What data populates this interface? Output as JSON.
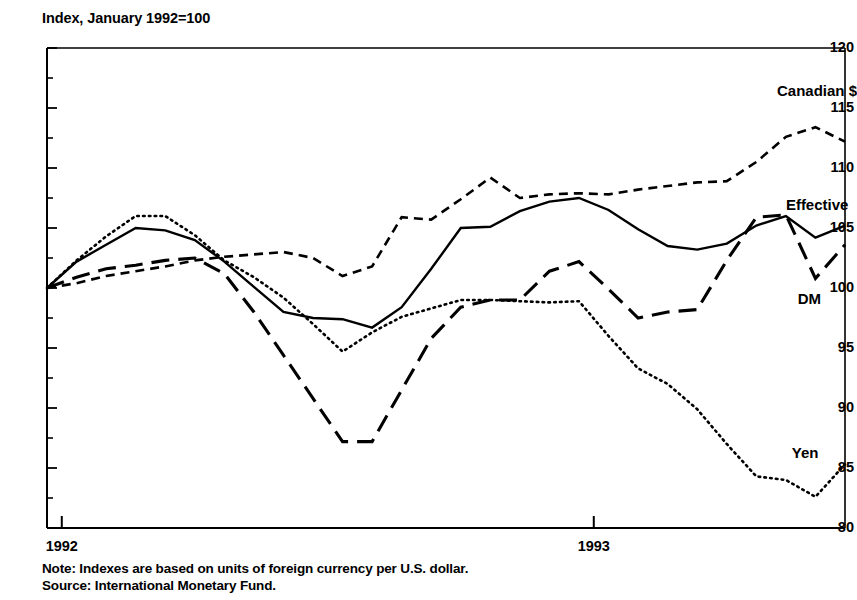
{
  "chart_data": {
    "type": "line",
    "title": "Index, January 1992=100",
    "xlabel": "",
    "ylabel": "Index, January 1992=100",
    "ylim": [
      80,
      120
    ],
    "ytick_labels": [
      "120",
      "115",
      "110",
      "105",
      "100",
      "95",
      "90",
      "85",
      "80"
    ],
    "ytick_values": [
      120,
      115,
      110,
      105,
      100,
      95,
      90,
      85,
      80
    ],
    "yminor_step": 2.5,
    "xtick_labels": [
      "1992",
      "1993"
    ],
    "xtick_values": [
      0.5,
      18.5
    ],
    "xlim": [
      0,
      27
    ],
    "grid": false,
    "legend": "inline-labels",
    "x": [
      0,
      1,
      2,
      3,
      4,
      5,
      6,
      7,
      8,
      9,
      10,
      11,
      12,
      13,
      14,
      15,
      16,
      17,
      18,
      19,
      20,
      21,
      22,
      23,
      24,
      25,
      26,
      27
    ],
    "series": [
      {
        "name": "Canadian $",
        "style": "short-dash",
        "label_x": 24.7,
        "label_y": 116.3,
        "values": [
          100.0,
          100.4,
          101.0,
          101.4,
          101.8,
          102.3,
          102.6,
          102.8,
          103.0,
          102.5,
          101.0,
          101.8,
          105.9,
          105.7,
          107.4,
          109.2,
          107.5,
          107.8,
          107.9,
          107.8,
          108.2,
          108.5,
          108.8,
          108.9,
          110.5,
          112.6,
          113.4,
          112.2
        ]
      },
      {
        "name": "Effective",
        "style": "solid",
        "label_x": 25.0,
        "label_y": 106.8,
        "values": [
          100.0,
          102.2,
          103.6,
          105.0,
          104.8,
          104.0,
          102.2,
          100.1,
          98.0,
          97.5,
          97.4,
          96.7,
          98.4,
          101.6,
          105.0,
          105.1,
          106.4,
          107.2,
          107.5,
          106.5,
          104.9,
          103.5,
          103.2,
          103.7,
          105.2,
          106.0,
          104.2,
          105.2
        ]
      },
      {
        "name": "DM",
        "style": "long-dash",
        "label_x": 25.4,
        "label_y": 99.0,
        "values": [
          100.0,
          100.9,
          101.6,
          101.9,
          102.3,
          102.5,
          101.2,
          98.0,
          94.4,
          90.8,
          87.2,
          87.2,
          91.5,
          95.8,
          98.4,
          99.0,
          99.0,
          101.4,
          102.2,
          99.9,
          97.5,
          98.0,
          98.2,
          102.3,
          105.9,
          106.1,
          100.8,
          103.6
        ]
      },
      {
        "name": "Yen",
        "style": "dotted",
        "label_x": 25.2,
        "label_y": 86.2,
        "values": [
          100.0,
          102.3,
          104.3,
          106.0,
          106.0,
          104.4,
          102.3,
          100.9,
          99.2,
          97.0,
          94.7,
          96.3,
          97.6,
          98.3,
          99.0,
          99.0,
          98.9,
          98.8,
          98.9,
          96.0,
          93.3,
          92.0,
          89.9,
          87.0,
          84.3,
          84.0,
          82.6,
          85.3
        ]
      }
    ],
    "notes": [
      "Note: Indexes are based on units of foreign currency per U.S. dollar.",
      "Source: International Monetary Fund."
    ]
  }
}
